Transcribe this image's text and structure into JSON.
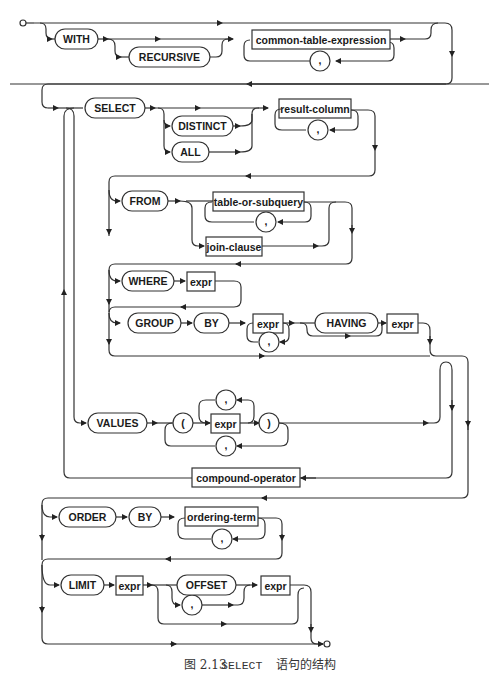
{
  "diagram": {
    "type": "railroad-syntax-diagram",
    "keywords": {
      "with": "WITH",
      "recursive": "RECURSIVE",
      "select": "SELECT",
      "distinct": "DISTINCT",
      "all": "ALL",
      "from": "FROM",
      "where": "WHERE",
      "group": "GROUP",
      "by": "BY",
      "having": "HAVING",
      "values": "VALUES",
      "order": "ORDER",
      "order_by": "BY",
      "limit": "LIMIT",
      "offset": "OFFSET",
      "lparen": "(",
      "rparen": ")",
      "comma": ","
    },
    "nonterminals": {
      "cte": "common-table-expression",
      "result_column": "result-column",
      "table_or_subquery": "table-or-subquery",
      "join_clause": "join-clause",
      "expr": "expr",
      "compound_operator": "compound-operator",
      "ordering_term": "ordering-term"
    }
  },
  "caption": {
    "figure": "图 2.13",
    "keyword": "SELECT",
    "text": "语句的结构"
  }
}
